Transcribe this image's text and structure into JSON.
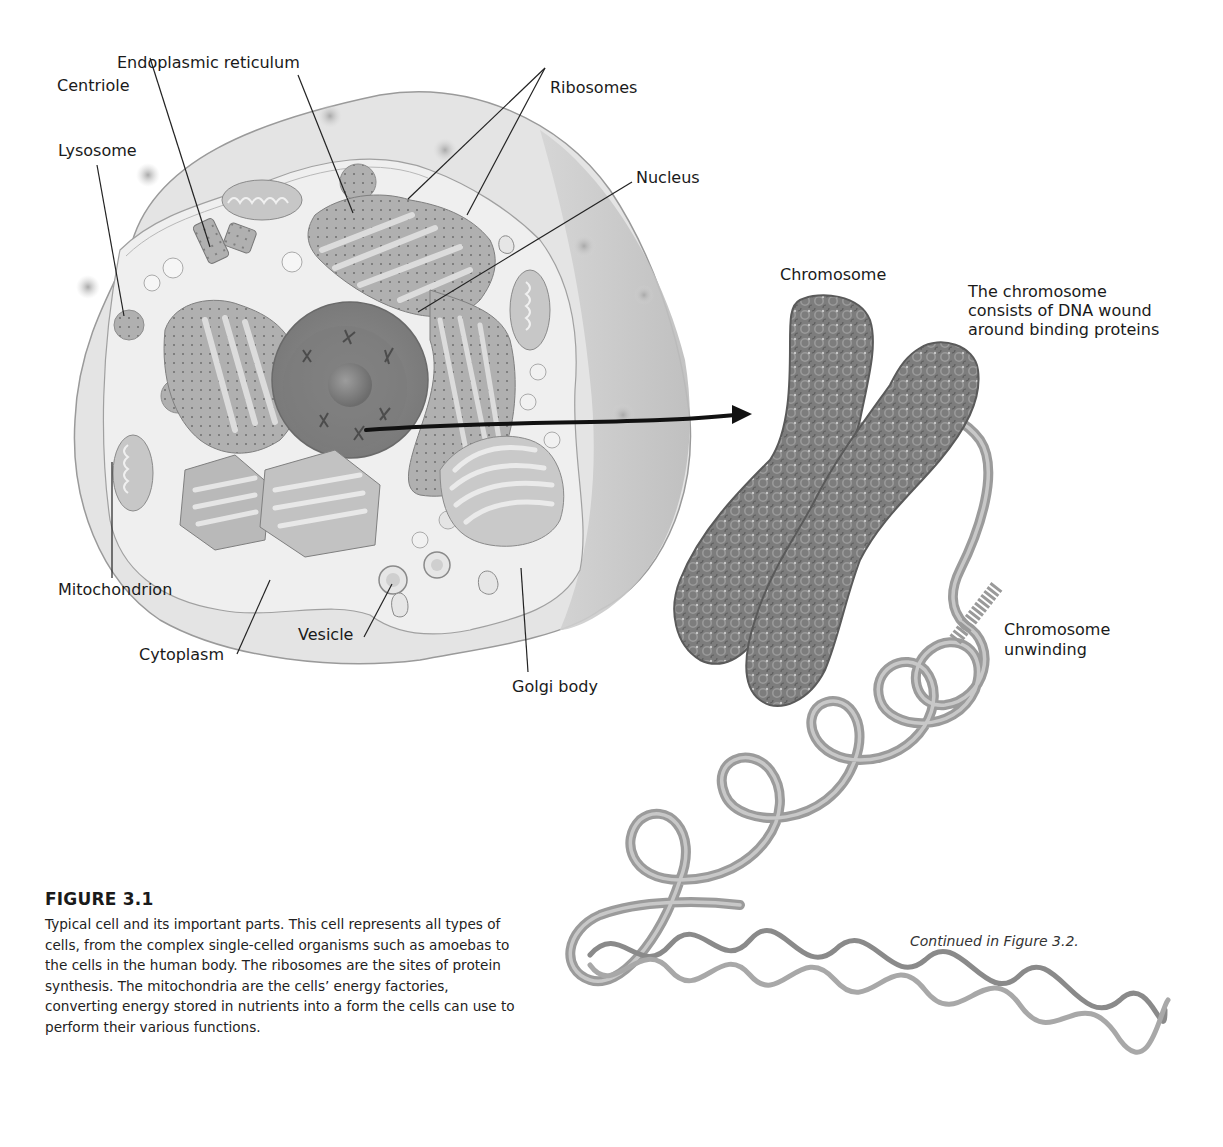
{
  "figure": {
    "number_label": "FIGURE 3.1",
    "caption": "Typical cell and its important parts. This cell represents all types of cells, from the complex single-celled organisms such as amoebas to the cells in the human body. The ribosomes are the sites of protein synthesis. The mitochondria are the cells’ energy factories, converting energy stored in nutrients into a form the cells can use to perform their various functions.",
    "continued_note": "Continued in Figure 3.2."
  },
  "cell_labels": {
    "endoplasmic_reticulum": "Endoplasmic reticulum",
    "centriole": "Centriole",
    "lysosome": "Lysosome",
    "ribosomes": "Ribosomes",
    "nucleus": "Nucleus",
    "mitochondrion": "Mitochondrion",
    "cytoplasm": "Cytoplasm",
    "vesicle": "Vesicle",
    "golgi_body": "Golgi body"
  },
  "chromosome_labels": {
    "chromosome": "Chromosome",
    "dna_description": "The chromosome consists of DNA wound around binding proteins",
    "dna_description_lines": [
      "The chromosome",
      "consists of DNA wound",
      "around binding proteins"
    ],
    "unwinding": "Chromosome unwinding",
    "unwinding_lines": [
      "Chromosome",
      "unwinding"
    ]
  },
  "colors": {
    "cell_outer": "#e2e2e2",
    "cell_shadow": "#bdbdbd",
    "cytoplasm": "#eeeeee",
    "organelle": "#b4b4b4",
    "nucleus": "#8a8a8a",
    "chromatin": "#7a7a7a",
    "dna_tube": "#a8a8a8",
    "leader_line": "#222222"
  }
}
